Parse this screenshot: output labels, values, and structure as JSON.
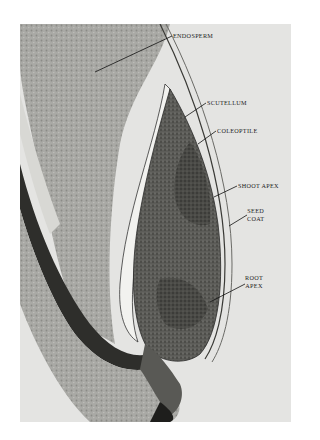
{
  "figure": {
    "background_color": "#ffffff",
    "photo_bg_color": "#e4e4e2",
    "labels": [
      {
        "id": "endosperm",
        "text": "ENDOSPERM"
      },
      {
        "id": "scutellum",
        "text": "SCUTELLUM"
      },
      {
        "id": "coleoptile",
        "text": "COLEOPTILE"
      },
      {
        "id": "shoot_apex",
        "text": "SHOOT APEX"
      },
      {
        "id": "seed_coat",
        "line1": "SEED",
        "line2": "COAT"
      },
      {
        "id": "root_apex",
        "line1": "ROOT",
        "line2": "APEX"
      }
    ]
  }
}
